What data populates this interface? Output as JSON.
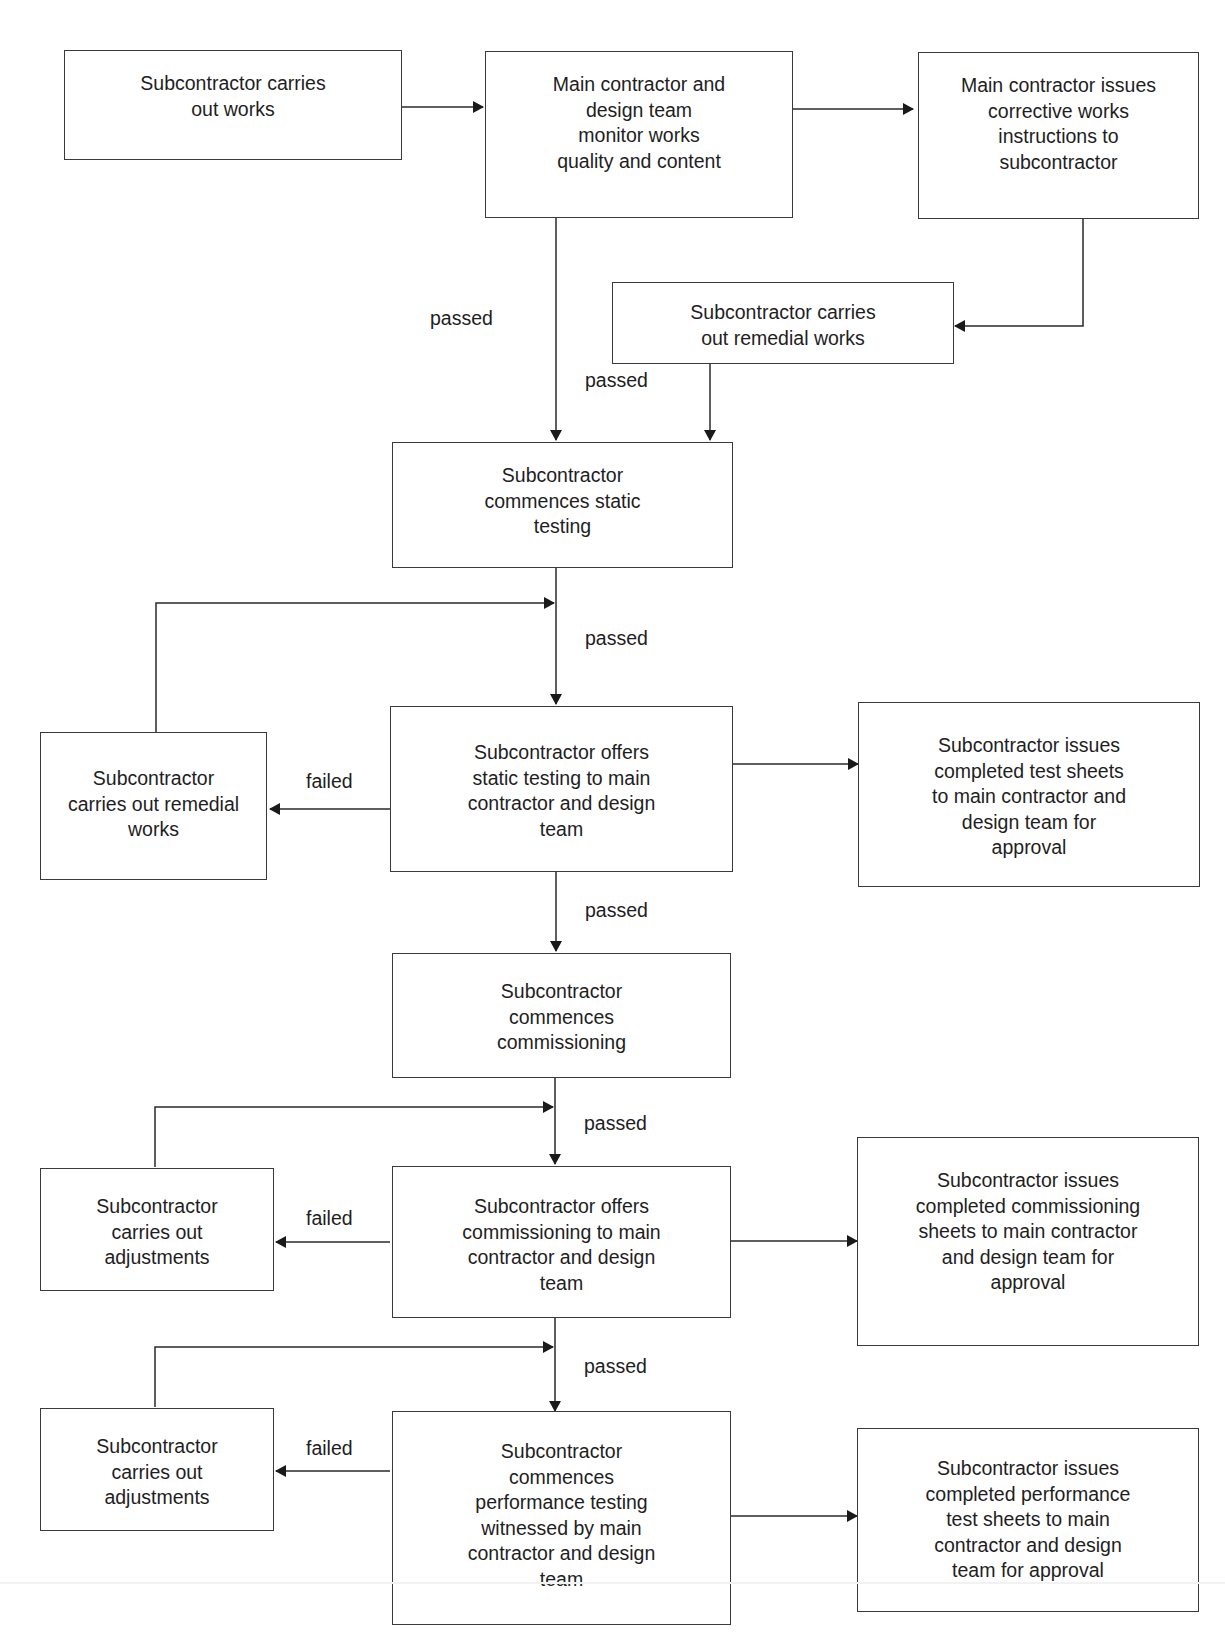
{
  "diagram": {
    "type": "flowchart",
    "boxes": {
      "carries_out_works": "Subcontractor carries\nout works",
      "monitor_works": "Main contractor and\ndesign team\nmonitor works\nquality and content",
      "corrective_instructions": "Main contractor issues\ncorrective works\ninstructions to\nsubcontractor",
      "remedial_works_top": "Subcontractor carries\nout remedial works",
      "static_testing": "Subcontractor\ncommences static\ntesting",
      "offers_static_testing": "Subcontractor offers\nstatic testing to main\ncontractor and design\nteam",
      "remedial_works_left": "Subcontractor\ncarries out remedial\nworks",
      "test_sheets": "Subcontractor issues\ncompleted test sheets\nto main contractor and\ndesign team for\napproval",
      "commissioning": "Subcontractor\ncommences\ncommissioning",
      "offers_commissioning": "Subcontractor offers\ncommissioning to main\ncontractor and design\nteam",
      "adjustments_1": "Subcontractor\ncarries out\nadjustments",
      "commissioning_sheets": "Subcontractor issues\ncompleted commissioning\nsheets to main contractor\nand design team for\napproval",
      "performance_testing": "Subcontractor\ncommences\nperformance testing\nwitnessed by main\ncontractor and design\nteam",
      "adjustments_2": "Subcontractor\ncarries out\nadjustments",
      "performance_sheets": "Subcontractor issues\ncompleted performance\ntest sheets to main\ncontractor and design\nteam for approval"
    },
    "edge_labels": {
      "passed_1": "passed",
      "passed_2": "passed",
      "passed_3": "passed",
      "failed_1": "failed",
      "passed_4": "passed",
      "passed_5": "passed",
      "failed_2": "failed",
      "passed_6": "passed",
      "failed_3": "failed"
    },
    "colors": {
      "line": "#2a2a2a",
      "border": "#3a3a3a",
      "text": "#1e1e1e",
      "background": "#ffffff"
    }
  }
}
